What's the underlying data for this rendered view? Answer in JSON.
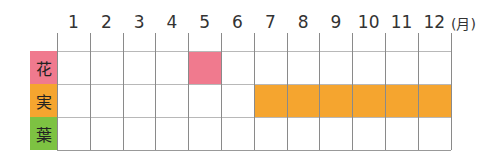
{
  "months": [
    "1",
    "2",
    "3",
    "4",
    "5",
    "6",
    "7",
    "8",
    "9",
    "10",
    "11",
    "12"
  ],
  "unit": "(月)",
  "rows": [
    {
      "label": "花",
      "color": "#f07a8e",
      "start": 5,
      "end": 5
    },
    {
      "label": "実",
      "color": "#f5a52f",
      "start": 7,
      "end": 12
    },
    {
      "label": "葉",
      "color": "#7dc242",
      "start": null,
      "end": null
    }
  ],
  "chart_data": {
    "type": "table",
    "title": "",
    "categories": [
      "1",
      "2",
      "3",
      "4",
      "5",
      "6",
      "7",
      "8",
      "9",
      "10",
      "11",
      "12"
    ],
    "xlabel": "(月)",
    "series": [
      {
        "name": "花",
        "months": [
          5
        ]
      },
      {
        "name": "実",
        "months": [
          7,
          8,
          9,
          10,
          11,
          12
        ]
      },
      {
        "name": "葉",
        "months": []
      }
    ]
  }
}
